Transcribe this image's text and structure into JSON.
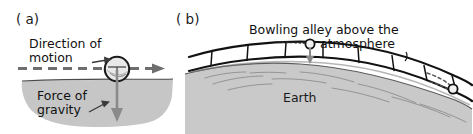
{
  "figure": {
    "background_color": "#ffffff",
    "ink_color": "#1a1a1a",
    "ground_fill_color": "#c6c6c6",
    "earth_fill_color": "#c9c9c9",
    "dashed_line_color": "#7a7a7a"
  },
  "panel_a": {
    "label": "( a)",
    "direction_label_line1": "Direction of",
    "direction_label_line2": "motion",
    "gravity_label_line1": "Force of",
    "gravity_label_line2": "gravity"
  },
  "panel_b": {
    "label": "( b)",
    "alley_label_line1": "Bowling alley above the",
    "alley_label_line2": "atmosphere",
    "earth_label": "Earth"
  }
}
